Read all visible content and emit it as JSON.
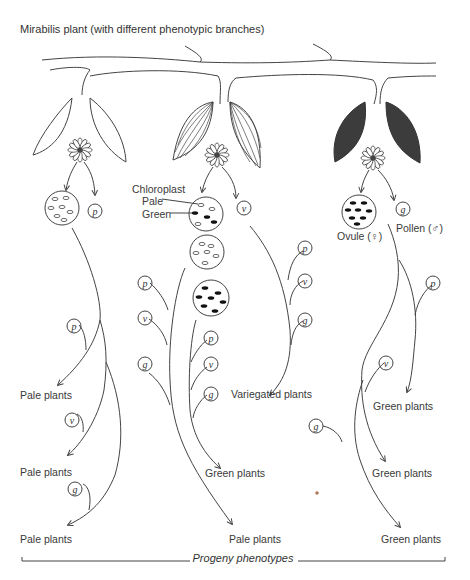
{
  "title": "Mirabilis plant (with different phenotypic branches)",
  "footer": "Progeny phenotypes",
  "labels": {
    "chloroplast": "Chloroplast",
    "pale": "Pale",
    "green": "Green",
    "ovule": "Ovule (♀)",
    "pollen": "Pollen (♂)"
  },
  "pollen_types": {
    "p": "p",
    "v": "v",
    "g": "g"
  },
  "branches": [
    {
      "name": "pale-branch",
      "leaf_style": "outline",
      "ovule_chloroplasts": "pale",
      "pollen": "p",
      "progeny": [
        "Pale plants",
        "Pale plants",
        "Pale plants"
      ],
      "crosses": [
        "p",
        "v",
        "g"
      ]
    },
    {
      "name": "variegated-branch",
      "leaf_style": "striped",
      "ovule_chloroplasts": "mixed",
      "pollen": "v",
      "progeny": [
        "Variegated plants",
        "Green plants",
        "Pale plants"
      ],
      "crosses": [
        "p",
        "v",
        "g"
      ]
    },
    {
      "name": "green-branch",
      "leaf_style": "filled",
      "ovule_chloroplasts": "green",
      "pollen": "g",
      "progeny": [
        "Green plants",
        "Green plants",
        "Green plants"
      ],
      "crosses": [
        "p",
        "v",
        "g"
      ]
    }
  ],
  "colors": {
    "line": "#444444",
    "fill_dark": "#3a3a3a",
    "text": "#333333"
  }
}
